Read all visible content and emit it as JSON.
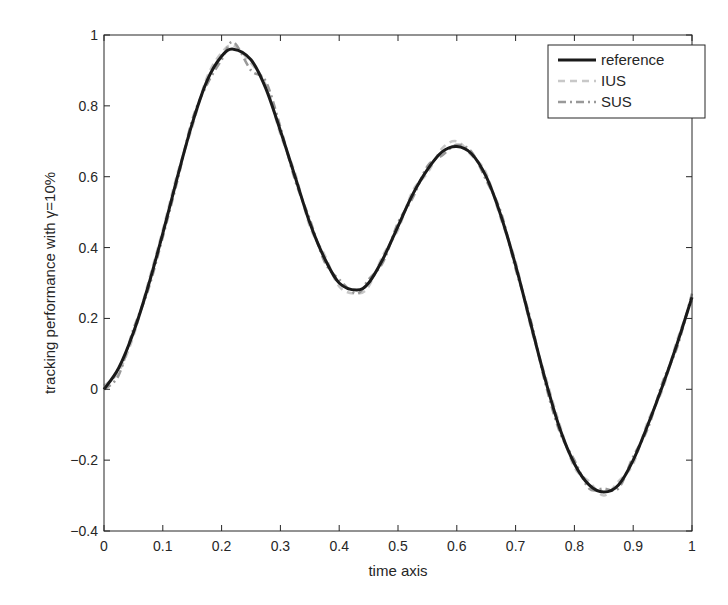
{
  "chart_data": {
    "type": "line",
    "title": "",
    "xlabel": "time axis",
    "ylabel": "tracking performance with γ=10%",
    "xlim": [
      0,
      1
    ],
    "ylim": [
      -0.4,
      1
    ],
    "xticks": [
      0,
      0.1,
      0.2,
      0.3,
      0.4,
      0.5,
      0.6,
      0.7,
      0.8,
      0.9,
      1
    ],
    "xtick_labels": [
      "0",
      "0.1",
      "0.2",
      "0.3",
      "0.4",
      "0.5",
      "0.6",
      "0.7",
      "0.8",
      "0.9",
      "1"
    ],
    "yticks": [
      -0.4,
      -0.2,
      0,
      0.2,
      0.4,
      0.6,
      0.8,
      1
    ],
    "ytick_labels": [
      "-0.4",
      "-0.2",
      "0",
      "0.2",
      "0.4",
      "0.6",
      "0.8",
      "1"
    ],
    "grid": false,
    "legend_position": "upper right",
    "x": [
      0,
      0.025,
      0.05,
      0.075,
      0.1,
      0.125,
      0.15,
      0.175,
      0.2,
      0.22,
      0.25,
      0.275,
      0.3,
      0.325,
      0.35,
      0.375,
      0.4,
      0.43,
      0.45,
      0.475,
      0.5,
      0.525,
      0.55,
      0.575,
      0.6,
      0.625,
      0.65,
      0.675,
      0.7,
      0.725,
      0.75,
      0.775,
      0.8,
      0.825,
      0.85,
      0.875,
      0.9,
      0.925,
      0.95,
      0.975,
      1
    ],
    "series": [
      {
        "name": "reference",
        "style": "solid",
        "color": "#1a1a1a",
        "values": [
          0.0,
          0.06,
          0.16,
          0.29,
          0.44,
          0.6,
          0.75,
          0.87,
          0.94,
          0.96,
          0.93,
          0.85,
          0.73,
          0.6,
          0.47,
          0.37,
          0.3,
          0.28,
          0.3,
          0.37,
          0.46,
          0.55,
          0.62,
          0.67,
          0.685,
          0.665,
          0.6,
          0.49,
          0.35,
          0.19,
          0.03,
          -0.11,
          -0.21,
          -0.27,
          -0.29,
          -0.27,
          -0.2,
          -0.1,
          0.01,
          0.13,
          0.26
        ]
      },
      {
        "name": "IUS",
        "style": "dashed",
        "color": "#c8c8c8",
        "values": [
          0.01,
          0.05,
          0.15,
          0.3,
          0.45,
          0.61,
          0.74,
          0.88,
          0.95,
          0.97,
          0.92,
          0.86,
          0.72,
          0.61,
          0.46,
          0.38,
          0.29,
          0.27,
          0.29,
          0.38,
          0.45,
          0.56,
          0.61,
          0.68,
          0.7,
          0.66,
          0.61,
          0.48,
          0.36,
          0.18,
          0.04,
          -0.1,
          -0.22,
          -0.26,
          -0.3,
          -0.26,
          -0.21,
          -0.09,
          0.0,
          0.14,
          0.25
        ]
      },
      {
        "name": "SUS",
        "style": "dashdot",
        "color": "#999999",
        "values": [
          0.0,
          0.04,
          0.17,
          0.28,
          0.43,
          0.59,
          0.76,
          0.86,
          0.93,
          0.98,
          0.9,
          0.87,
          0.74,
          0.59,
          0.48,
          0.36,
          0.31,
          0.27,
          0.31,
          0.36,
          0.47,
          0.54,
          0.63,
          0.66,
          0.69,
          0.67,
          0.59,
          0.5,
          0.34,
          0.2,
          0.02,
          -0.12,
          -0.2,
          -0.28,
          -0.28,
          -0.28,
          -0.19,
          -0.11,
          0.02,
          0.12,
          0.27
        ]
      }
    ]
  },
  "legend": {
    "items": [
      {
        "label": "reference"
      },
      {
        "label": "IUS"
      },
      {
        "label": "SUS"
      }
    ]
  }
}
